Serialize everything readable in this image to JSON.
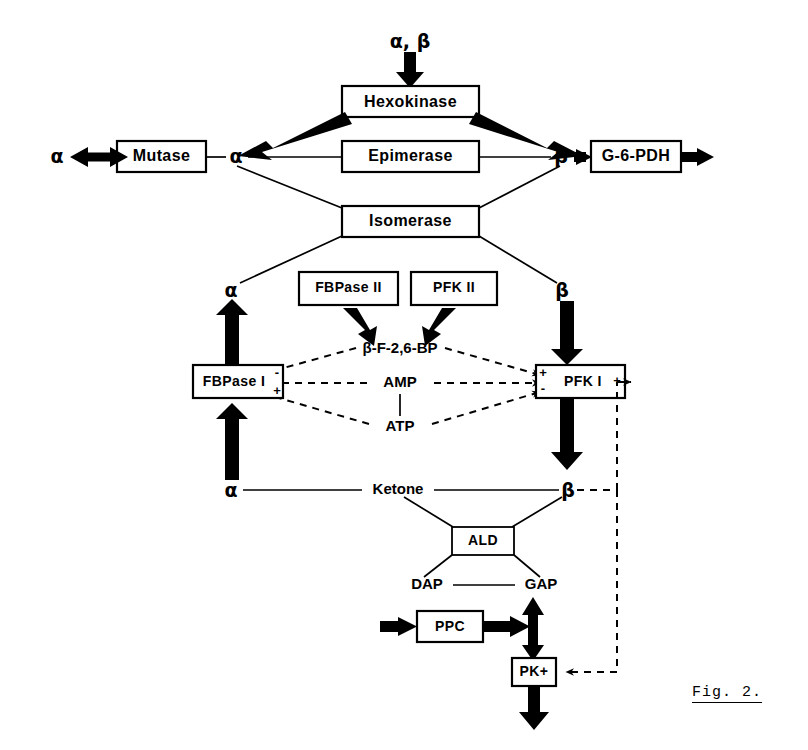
{
  "figure": {
    "caption": "Fig. 2.",
    "domain_title": "Glucose anomer metabolism pathway diagram"
  },
  "nodes": {
    "hexokinase": "Hexokinase",
    "epimerase": "Epimerase",
    "isomerase": "Isomerase",
    "mutase": "Mutase",
    "g6pdh": "G-6-PDH",
    "fbpase2": "FBPase II",
    "pfk2": "PFK  II",
    "fbpase1": "FBPase I",
    "pfk1": "PFK I",
    "ald": "ALD",
    "ppc": "PPC",
    "pk": "PK+"
  },
  "metabolites": {
    "input": "α, β",
    "alpha": "α",
    "beta": "β",
    "fbp26": "β-F-2,6-BP",
    "amp": "AMP",
    "atp": "ATP",
    "ketone": "Ketone",
    "dap": "DAP",
    "gap": "GAP"
  },
  "signs": {
    "minus": "-",
    "plus": "+"
  },
  "colors": {
    "stroke": "#000000",
    "background": "#ffffff"
  }
}
